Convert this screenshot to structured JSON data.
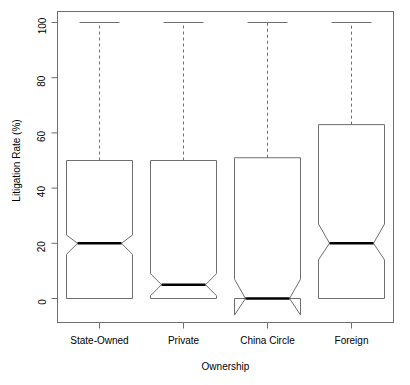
{
  "chart_data": {
    "type": "boxplot",
    "title": "",
    "xlabel": "Ownership",
    "ylabel": "Litigation Rate (%)",
    "categories": [
      "State-Owned",
      "Private",
      "China Circle",
      "Foreign"
    ],
    "ylim": [
      0,
      100
    ],
    "y_ticks": [
      0,
      20,
      40,
      60,
      80,
      100
    ],
    "y_tick_labels": [
      "0",
      "20",
      "40",
      "60",
      "80",
      "100"
    ],
    "grid": false,
    "legend": null,
    "notched": true,
    "series": [
      {
        "name": "State-Owned",
        "min": 0,
        "q1": 0,
        "median": 20,
        "q3": 50,
        "max": 100,
        "notch_lower": 16,
        "notch_upper": 23,
        "lower_whisker": 0,
        "upper_whisker": 100
      },
      {
        "name": "Private",
        "min": 0,
        "q1": 0,
        "median": 5,
        "q3": 50,
        "max": 100,
        "notch_lower": 1,
        "notch_upper": 9,
        "lower_whisker": 0,
        "upper_whisker": 100
      },
      {
        "name": "China Circle",
        "min": 0,
        "q1": 0,
        "median": 0,
        "q3": 51,
        "max": 100,
        "notch_lower": -6,
        "notch_upper": 7,
        "lower_whisker": 0,
        "upper_whisker": 100
      },
      {
        "name": "Foreign",
        "min": 0,
        "q1": 0,
        "median": 20,
        "q3": 63,
        "max": 100,
        "notch_lower": 14,
        "notch_upper": 27,
        "lower_whisker": 0,
        "upper_whisker": 100
      }
    ],
    "colors": {
      "box_stroke": "#6e6e6e",
      "median_stroke": "#000000",
      "whisker_stroke": "#6e6e6e",
      "axis_stroke": "#6e6e6e",
      "background": "#ffffff"
    }
  },
  "axis": {
    "y_label": "Litigation Rate (%)",
    "x_label": "Ownership"
  },
  "ticks": {
    "y": [
      "0",
      "20",
      "40",
      "60",
      "80",
      "100"
    ],
    "x": [
      "State-Owned",
      "Private",
      "China Circle",
      "Foreign"
    ]
  }
}
